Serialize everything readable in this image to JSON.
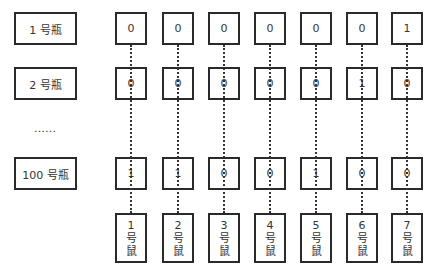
{
  "bottles": [
    {
      "label": "1 号瓶",
      "bits": [
        "0",
        "0",
        "0",
        "0",
        "0",
        "0",
        "1"
      ]
    },
    {
      "label": "2 号瓶",
      "bits": [
        "0",
        "0",
        "0",
        "0",
        "0",
        "1",
        "0"
      ]
    },
    {
      "label": "100 号瓶",
      "bits": [
        "1",
        "1",
        "0",
        "0",
        "1",
        "0",
        "0"
      ]
    }
  ],
  "ellipsis": "……",
  "mice": [
    {
      "num": "1",
      "unit": "号",
      "name": "鼠"
    },
    {
      "num": "2",
      "unit": "号",
      "name": "鼠"
    },
    {
      "num": "3",
      "unit": "号",
      "name": "鼠"
    },
    {
      "num": "4",
      "unit": "号",
      "name": "鼠"
    },
    {
      "num": "5",
      "unit": "号",
      "name": "鼠"
    },
    {
      "num": "6",
      "unit": "号",
      "name": "鼠"
    },
    {
      "num": "7",
      "unit": "号",
      "name": "鼠"
    }
  ],
  "colors": {
    "border": "#2a2a2a",
    "text": "#333333",
    "background": "#ffffff"
  }
}
